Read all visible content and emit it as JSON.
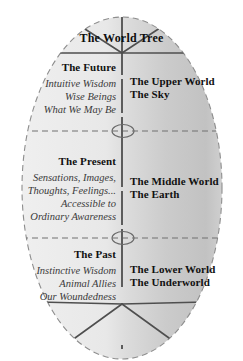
{
  "diagram": {
    "title": "The World Tree",
    "shape": "vertical-ellipse",
    "colors": {
      "fill_left": "#e9e9e9",
      "fill_right": "#c9c9c9",
      "outline": "#8a8a8a",
      "divider": "#6b6b6b",
      "branch": "#5a5a5a",
      "text": "#111111",
      "text_italic": "#3a3a3a",
      "background": "#ffffff"
    },
    "structure": {
      "crown_label": "The World Tree",
      "trunk": "vertical-center-line",
      "branch_count": 4,
      "root_count": 4,
      "node_markers": 2,
      "horizontal_dividers": 2
    },
    "sections": [
      {
        "id": "upper",
        "left": {
          "heading": "The Future",
          "lines": [
            "Intuitive Wisdom",
            "Wise Beings",
            "What We May Be"
          ]
        },
        "right": {
          "lines": [
            "The Upper World",
            "The Sky"
          ]
        }
      },
      {
        "id": "middle",
        "left": {
          "heading": "The Present",
          "lines": [
            "Sensations, Images,",
            "Thoughts, Feelings...",
            "Accessible to",
            "Ordinary Awareness"
          ]
        },
        "right": {
          "lines": [
            "The Middle World",
            "The Earth"
          ]
        }
      },
      {
        "id": "lower",
        "left": {
          "heading": "The Past",
          "lines": [
            "Instinctive Wisdom",
            "Animal Allies",
            "Our Woundedness"
          ]
        },
        "right": {
          "lines": [
            "The Lower World",
            "The Underworld"
          ]
        }
      }
    ]
  }
}
